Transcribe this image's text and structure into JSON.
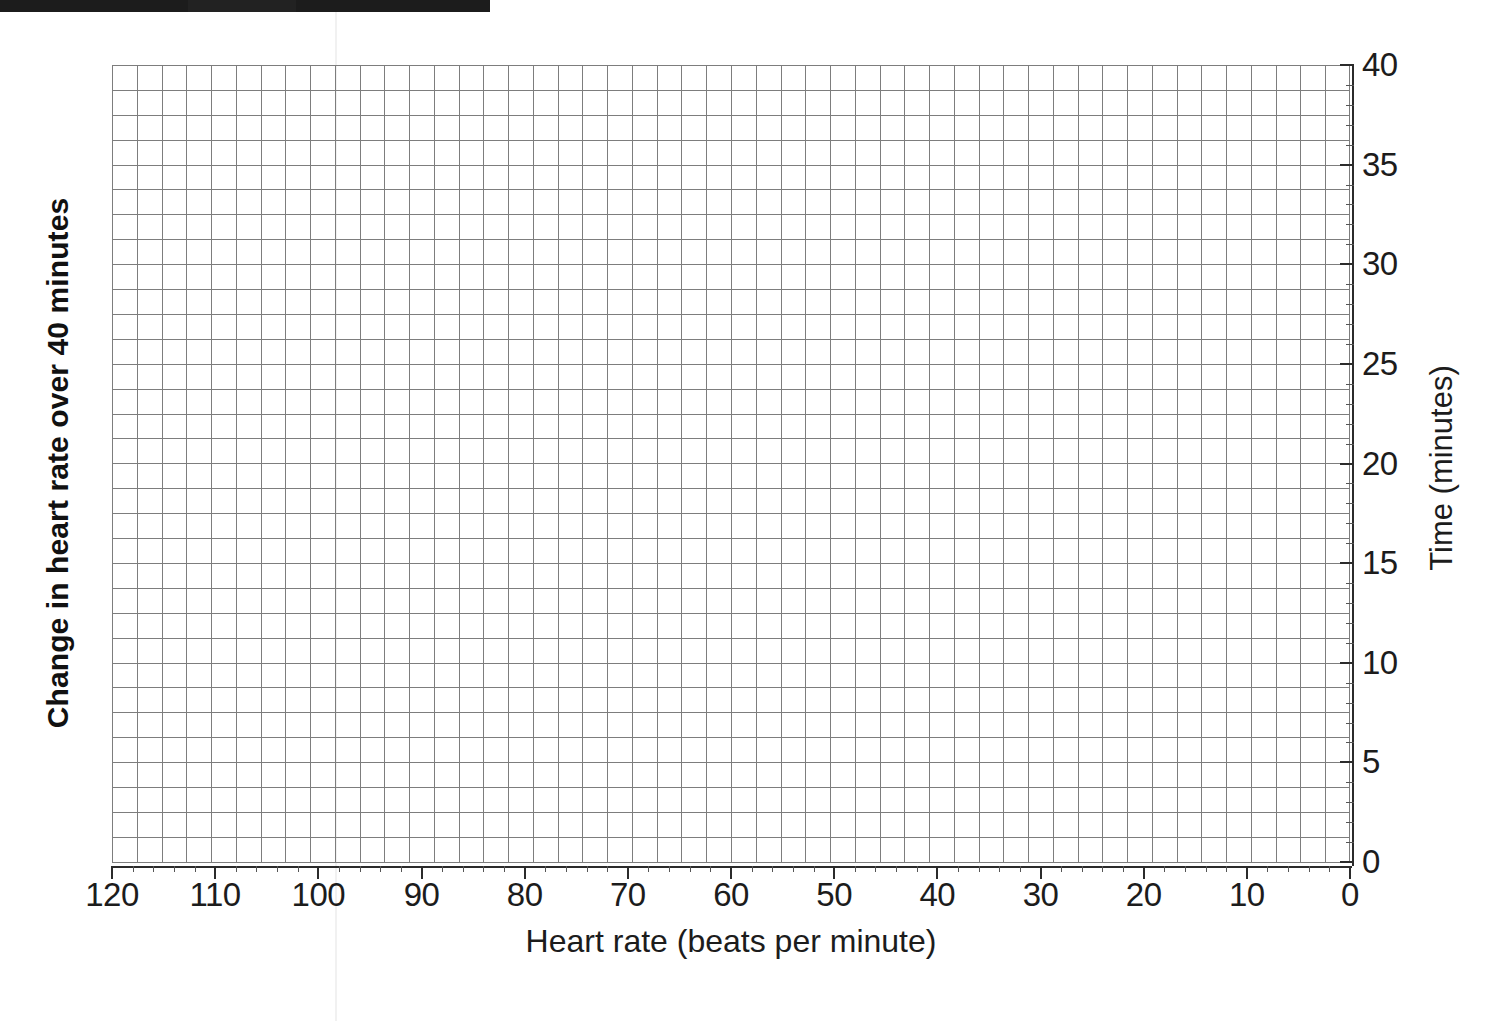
{
  "banner": {
    "label": "page-header-band"
  },
  "chart_data": {
    "type": "line",
    "title": "",
    "subtitle": "",
    "xlabel": "Heart rate (beats per minute)",
    "ylabel": "Time (minutes)",
    "y_left_label": "Change in heart rate over 40 minutes",
    "grid": true,
    "legend": null,
    "xlim": [
      120,
      0
    ],
    "ylim": [
      0,
      40
    ],
    "x_axis_reversed": true,
    "x_ticks": [
      120,
      110,
      100,
      90,
      80,
      70,
      60,
      50,
      40,
      30,
      20,
      10,
      0
    ],
    "x_tick_labels": [
      "120",
      "110",
      "100",
      "90",
      "80",
      "70",
      "60",
      "50",
      "40",
      "30",
      "20",
      "10",
      "0"
    ],
    "x_minor_tick_step": 2,
    "y_ticks": [
      0,
      5,
      10,
      15,
      20,
      25,
      30,
      35,
      40
    ],
    "y_tick_labels": [
      "0",
      "5",
      "10",
      "15",
      "20",
      "25",
      "30",
      "35",
      "40"
    ],
    "y_minor_tick_step": 1,
    "y_axis_position": "right",
    "grid_columns": 50,
    "grid_rows": 32,
    "series": [],
    "values": [],
    "annotations": [],
    "note": "Blank graph paper grid provided for plotting; no data points are drawn."
  },
  "axes": {
    "x_title": "Heart rate (beats per minute)",
    "y_right_title": "Time (minutes)",
    "y_left_title": "Change in heart rate over 40 minutes"
  },
  "colors": {
    "grid_line": "#7d7d7d",
    "axis_line": "#2b2b2b",
    "text": "#1c1c1c",
    "banner": "#1c1c1c",
    "background": "#ffffff"
  }
}
